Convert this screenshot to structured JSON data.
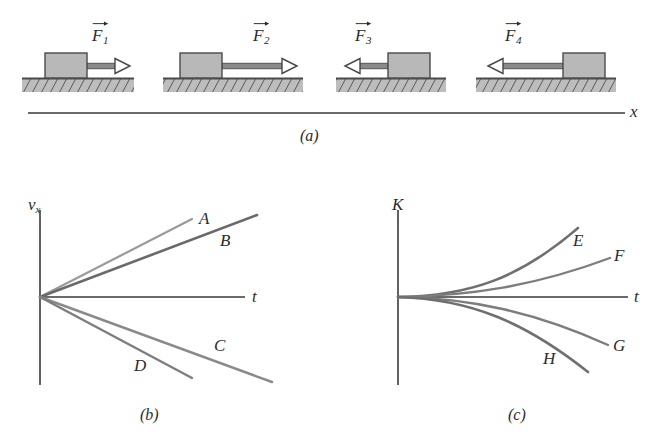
{
  "figure": {
    "panels": [
      {
        "id": "a",
        "caption": "(a)",
        "caption_x": 300,
        "caption_y": 128
      },
      {
        "id": "b",
        "caption": "(b)",
        "caption_x": 140,
        "caption_y": 407
      },
      {
        "id": "c",
        "caption": "(c)",
        "caption_x": 508,
        "caption_y": 407
      }
    ]
  },
  "panel_a": {
    "axis_label": "x",
    "axis_label_x": 630,
    "axis_label_y": 103,
    "axis_line": {
      "x1": 28,
      "y1": 113,
      "x2": 625,
      "y2": 113
    },
    "blocks": [
      {
        "name": "block-1",
        "force_label": "F",
        "force_subscript": "1",
        "label_x": 92,
        "label_y": 27,
        "direction": "right",
        "block": {
          "x": 45,
          "y": 53,
          "w": 42,
          "h": 25
        },
        "arrow": {
          "x1": 87,
          "y1": 66,
          "x2": 130,
          "y2": 66
        },
        "ground": {
          "x": 22,
          "y": 78,
          "w": 112,
          "h": 14
        }
      },
      {
        "name": "block-2",
        "force_label": "F",
        "force_subscript": "2",
        "label_x": 253,
        "label_y": 27,
        "direction": "right",
        "block": {
          "x": 180,
          "y": 53,
          "w": 42,
          "h": 25
        },
        "arrow": {
          "x1": 222,
          "y1": 66,
          "x2": 297,
          "y2": 66
        },
        "ground": {
          "x": 163,
          "y": 78,
          "w": 140,
          "h": 14
        }
      },
      {
        "name": "block-3",
        "force_label": "F",
        "force_subscript": "3",
        "label_x": 355,
        "label_y": 27,
        "direction": "left",
        "block": {
          "x": 388,
          "y": 53,
          "w": 42,
          "h": 25
        },
        "arrow": {
          "x1": 388,
          "y1": 66,
          "x2": 345,
          "y2": 66
        },
        "ground": {
          "x": 336,
          "y": 78,
          "w": 110,
          "h": 14
        }
      },
      {
        "name": "block-4",
        "force_label": "F",
        "force_subscript": "4",
        "label_x": 505,
        "label_y": 27,
        "direction": "left",
        "block": {
          "x": 563,
          "y": 53,
          "w": 42,
          "h": 25
        },
        "arrow": {
          "x1": 563,
          "y1": 66,
          "x2": 488,
          "y2": 66
        },
        "ground": {
          "x": 476,
          "y": 78,
          "w": 140,
          "h": 14
        }
      }
    ]
  },
  "chart_data": [
    {
      "type": "line",
      "panel": "b",
      "title": "(b)",
      "xlabel": "t",
      "ylabel": "v_x",
      "grid": false,
      "legend": "inline-end-labels",
      "axis_origin": {
        "x": 40,
        "y": 297
      },
      "y_axis": {
        "x": 40,
        "y_top": 210,
        "y_bottom": 385
      },
      "x_axis": {
        "y": 297,
        "x_left": 40,
        "x_right": 245
      },
      "x_axis_label_pos": {
        "x": 252,
        "y": 288
      },
      "y_axis_label_pos": {
        "x": 28,
        "y": 196
      },
      "series": [
        {
          "name": "A",
          "slope_desc": "steep positive",
          "color": "#9a9a9a",
          "line_width": 2.2,
          "x1": 40,
          "y1": 297,
          "x2": 192,
          "y2": 219,
          "label_x": 199,
          "label_y": 210
        },
        {
          "name": "B",
          "slope_desc": "moderate positive",
          "color": "#6a6a6a",
          "line_width": 2.6,
          "x1": 40,
          "y1": 297,
          "x2": 257,
          "y2": 215,
          "label_x": 220,
          "label_y": 232
        },
        {
          "name": "C",
          "slope_desc": "moderate negative",
          "color": "#8a8a8a",
          "line_width": 2.4,
          "x1": 40,
          "y1": 297,
          "x2": 272,
          "y2": 382,
          "label_x": 214,
          "label_y": 337
        },
        {
          "name": "D",
          "slope_desc": "steep negative",
          "color": "#7d7d7d",
          "line_width": 2.4,
          "x1": 40,
          "y1": 297,
          "x2": 192,
          "y2": 378,
          "label_x": 134,
          "label_y": 357
        }
      ]
    },
    {
      "type": "line",
      "panel": "c",
      "title": "(c)",
      "xlabel": "t",
      "ylabel": "K",
      "grid": false,
      "legend": "inline-end-labels",
      "axis_origin": {
        "x": 398,
        "y": 297
      },
      "y_axis": {
        "x": 398,
        "y_top": 210,
        "y_bottom": 385
      },
      "x_axis": {
        "y": 297,
        "x_left": 398,
        "x_right": 628
      },
      "x_axis_label_pos": {
        "x": 634,
        "y": 288
      },
      "y_axis_label_pos": {
        "x": 392,
        "y": 196
      },
      "series": [
        {
          "name": "E",
          "curve_desc": "strong upward curvature",
          "color": "#6f6f6f",
          "line_width": 2.6,
          "path": "M398,297 C470,296 520,278 578,228",
          "label_x": 573,
          "label_y": 232
        },
        {
          "name": "F",
          "curve_desc": "mild upward curvature",
          "color": "#7d7d7d",
          "line_width": 2.4,
          "path": "M398,297 C470,296 535,286 610,258",
          "label_x": 614,
          "label_y": 247
        },
        {
          "name": "G",
          "curve_desc": "mild downward curvature",
          "color": "#7d7d7d",
          "line_width": 2.4,
          "path": "M398,297 C470,298 535,312 608,345",
          "label_x": 613,
          "label_y": 337
        },
        {
          "name": "H",
          "curve_desc": "strong downward curvature",
          "color": "#6f6f6f",
          "line_width": 2.6,
          "path": "M398,297 C470,299 525,322 588,372",
          "label_x": 543,
          "label_y": 350
        }
      ]
    }
  ],
  "colors": {
    "block_fill": "#b8b8b8",
    "block_stroke": "#4a4a4a",
    "ground_fill": "#bdbdbd",
    "ground_stroke": "#4a4a4a",
    "arrow_shaft": "#8a8a8a",
    "arrow_outline": "#4a4a4a",
    "axis": "#3a3a3a",
    "text": "#2b2b2b"
  }
}
